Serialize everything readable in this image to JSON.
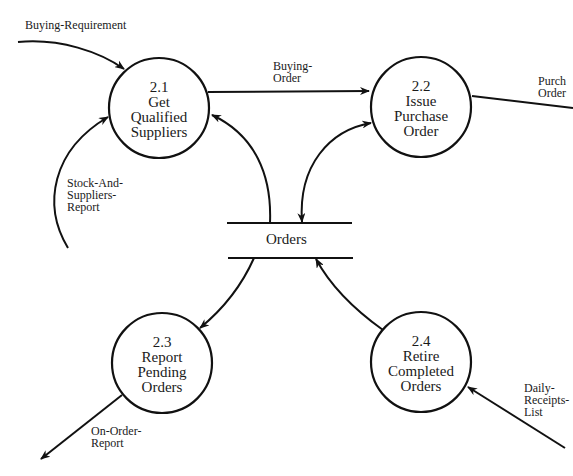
{
  "diagram": {
    "type": "data-flow-diagram",
    "processes": [
      {
        "id": "2.1",
        "name_lines": [
          "Get",
          "Qualified",
          "Suppliers"
        ],
        "cx": 159,
        "cy": 108,
        "r": 50
      },
      {
        "id": "2.2",
        "name_lines": [
          "Issue",
          "Purchase",
          "Order"
        ],
        "cx": 421,
        "cy": 107,
        "r": 50
      },
      {
        "id": "2.3",
        "name_lines": [
          "Report",
          "Pending",
          "Orders"
        ],
        "cx": 162,
        "cy": 363,
        "r": 50
      },
      {
        "id": "2.4",
        "name_lines": [
          "Retire",
          "Completed",
          "Orders"
        ],
        "cx": 421,
        "cy": 362,
        "r": 50
      }
    ],
    "data_store": {
      "name": "Orders"
    },
    "flows": [
      {
        "name": "buying-requirement",
        "label_lines": [
          "Buying-Requirement"
        ],
        "from": "external",
        "to": "2.1"
      },
      {
        "name": "buying-order",
        "label_lines": [
          "Buying-",
          "Order"
        ],
        "from": "2.1",
        "to": "2.2"
      },
      {
        "name": "purchase-order",
        "label_lines": [
          "Purch",
          "Order"
        ],
        "from": "2.2",
        "to": "external"
      },
      {
        "name": "stock-and-suppliers-report",
        "label_lines": [
          "Stock-And-",
          "Suppliers-",
          "Report"
        ],
        "from": "external",
        "to": "2.1"
      },
      {
        "name": "orders-to-2-1",
        "label_lines": [],
        "from": "Orders",
        "to": "2.1"
      },
      {
        "name": "orders-2-2",
        "label_lines": [],
        "from": "2.2",
        "to": "Orders",
        "bidirectional": true
      },
      {
        "name": "orders-to-2-3",
        "label_lines": [],
        "from": "Orders",
        "to": "2.3"
      },
      {
        "name": "2-4-to-orders",
        "label_lines": [],
        "from": "2.4",
        "to": "Orders"
      },
      {
        "name": "on-order-report",
        "label_lines": [
          "On-Order-",
          "Report"
        ],
        "from": "2.3",
        "to": "external"
      },
      {
        "name": "daily-receipts-list",
        "label_lines": [
          "Daily-",
          "Receipts-",
          "List"
        ],
        "from": "external",
        "to": "2.4"
      }
    ],
    "colors": {
      "stroke": "#111111",
      "background": "#ffffff",
      "text": "#1a1a1a"
    }
  }
}
